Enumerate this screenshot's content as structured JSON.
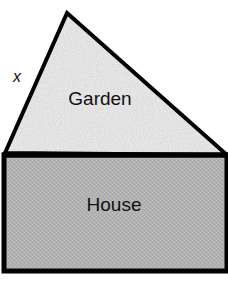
{
  "figure": {
    "type": "geometry-diagram",
    "background_color": "#ffffff",
    "outline_color": "#000000",
    "canvas": {
      "width": 228,
      "height": 287
    },
    "regions": [
      {
        "id": "garden",
        "label": "Garden",
        "shape": "triangle",
        "fill_color": "#d4d4d4",
        "fill_texture": "coarse-speckle",
        "points": "67,13 227,155 5,153"
      },
      {
        "id": "house",
        "label": "House",
        "shape": "rectangle",
        "fill_color": "#b4b4b4",
        "fill_texture": "fine-dither",
        "points": "4,155 227,155 227,271 4,271"
      }
    ],
    "annotations": [
      {
        "id": "side-x",
        "text": "x",
        "style": "italic",
        "refers_to": "left-slanted-edge-of-garden"
      }
    ]
  }
}
